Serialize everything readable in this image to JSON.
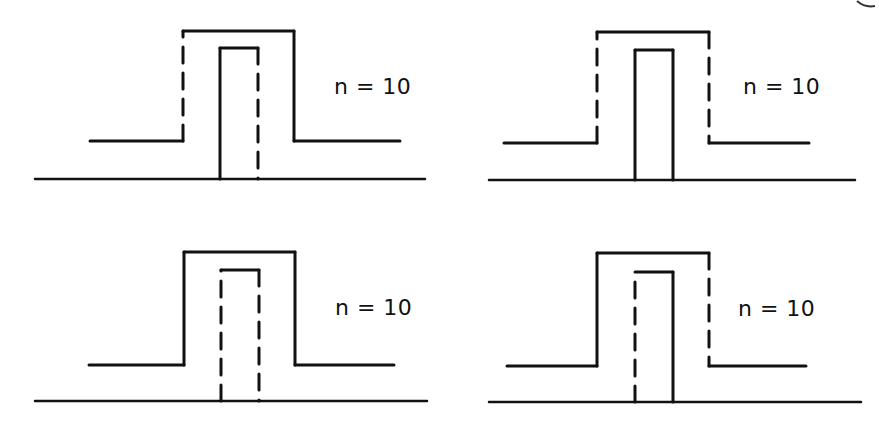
{
  "figure": {
    "stroke_color": "#111111",
    "background": "#ffffff",
    "panels": [
      {
        "id": "top-left",
        "label": "n = 10",
        "outer": {
          "left_dashed": true,
          "right_dashed": false
        },
        "inner": {
          "left_dashed": false,
          "right_dashed": true
        }
      },
      {
        "id": "top-right",
        "label": "n = 10",
        "outer": {
          "left_dashed": true,
          "right_dashed": true
        },
        "inner": {
          "left_dashed": false,
          "right_dashed": false
        }
      },
      {
        "id": "bottom-left",
        "label": "n = 10",
        "outer": {
          "left_dashed": false,
          "right_dashed": false
        },
        "inner": {
          "left_dashed": true,
          "right_dashed": true
        }
      },
      {
        "id": "bottom-right",
        "label": "n = 10",
        "outer": {
          "left_dashed": false,
          "right_dashed": true
        },
        "inner": {
          "left_dashed": true,
          "right_dashed": false
        }
      }
    ]
  }
}
